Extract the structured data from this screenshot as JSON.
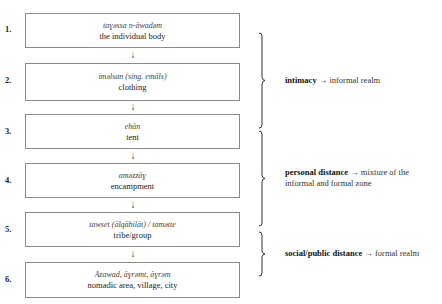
{
  "steps": [
    {
      "number": "1.",
      "term": "taɣəssa n-ăwadəm",
      "gloss": "the individual body"
    },
    {
      "number": "2.",
      "term": "iməlsan (sing. emăls)",
      "gloss": "clothing"
    },
    {
      "number": "3.",
      "term": "ehăn",
      "gloss": "tent"
    },
    {
      "number": "4.",
      "term": "aməzzăɣ",
      "gloss": "encampment"
    },
    {
      "number": "5.",
      "term": "tawset (ălqăbilăt) / tamətte",
      "gloss": "tribe/group"
    },
    {
      "number": "6.",
      "term": "Azawad, ăɣrəmt, ăɣrəm",
      "gloss": "nomadic area, village, city"
    }
  ],
  "arrow_glyph": "↓",
  "groups": [
    {
      "key": "intimacy",
      "arrow": "→",
      "line1": "informal realm",
      "line2": ""
    },
    {
      "key": "personal distance",
      "arrow": "→",
      "line1": "mixture of the",
      "line2": "informal and formal zone"
    },
    {
      "key": "social/public distance",
      "arrow": "→",
      "line1": "formal realm",
      "line2": ""
    }
  ],
  "colors": {
    "box_border": "#8a8a8a",
    "text": "#222222",
    "brace": "#333333"
  }
}
